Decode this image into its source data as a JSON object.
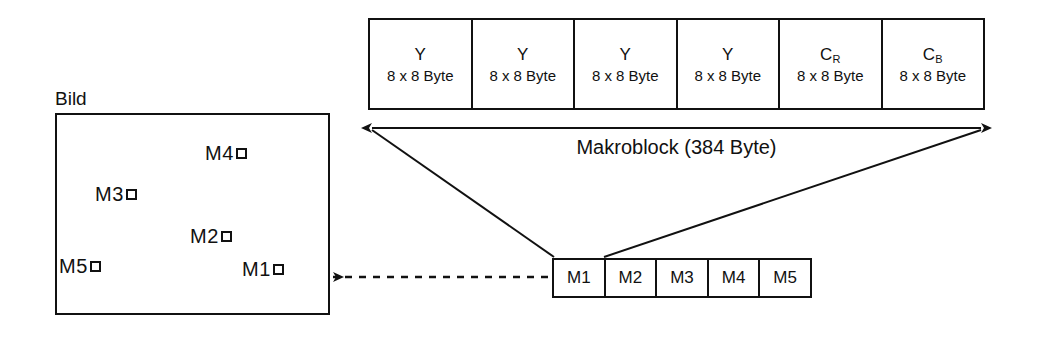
{
  "figure": {
    "background_color": "#ffffff",
    "line_color": "#111111"
  },
  "macroblock_table": {
    "span_label": "Makroblock (384 Byte)",
    "cells": [
      {
        "component": "Y",
        "subscript": "",
        "size": "8 x 8 Byte"
      },
      {
        "component": "Y",
        "subscript": "",
        "size": "8 x 8 Byte"
      },
      {
        "component": "Y",
        "subscript": "",
        "size": "8 x 8 Byte"
      },
      {
        "component": "Y",
        "subscript": "",
        "size": "8 x 8 Byte"
      },
      {
        "component": "C",
        "subscript": "R",
        "size": "8 x 8 Byte"
      },
      {
        "component": "C",
        "subscript": "B",
        "size": "8 x 8 Byte"
      }
    ]
  },
  "picture": {
    "label": "Bild",
    "macroblocks": [
      {
        "label": "M4",
        "left": 148,
        "top": 27
      },
      {
        "label": "M3",
        "left": 38,
        "top": 68
      },
      {
        "label": "M2",
        "left": 133,
        "top": 110
      },
      {
        "label": "M5",
        "left": 2,
        "top": 140
      },
      {
        "label": "M1",
        "left": 185,
        "top": 143
      }
    ]
  },
  "sequence_strip": {
    "cells": [
      "M1",
      "M2",
      "M3",
      "M4",
      "M5"
    ]
  },
  "connectors": {
    "span_arrow_name": "macroblock-span-arrow",
    "left_diagonal_name": "macroblock-left-connector",
    "right_diagonal_name": "macroblock-right-connector",
    "dashed_arrow_name": "picture-to-sequence-arrow"
  }
}
